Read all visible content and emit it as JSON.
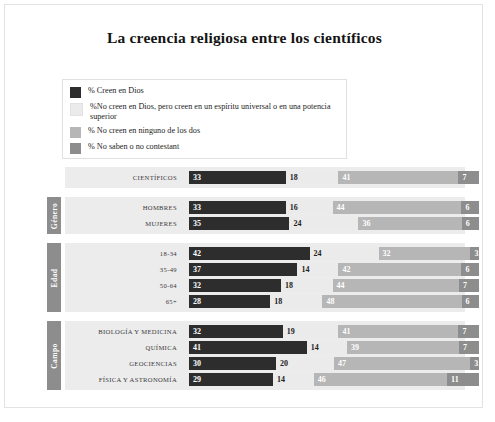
{
  "chart_data": {
    "type": "bar",
    "subtype": "stacked-horizontal-100",
    "title": "La creencia religiosa entre los científicos",
    "xlabel": "",
    "ylabel": "",
    "xlim": [
      0,
      100
    ],
    "grid": false,
    "legend_position": "top-left",
    "series": [
      {
        "name": "% Creen en Dios",
        "color": "#2d2d2d"
      },
      {
        "name": "%No creen en Dios, pero creen en un espíritu universal o en una potencia superior",
        "color": "#ebebeb"
      },
      {
        "name": "%  No creen en ninguno de los dos",
        "color": "#b6b6b6"
      },
      {
        "name": "% No saben o no contestant",
        "color": "#8d8d8d"
      }
    ],
    "groups": [
      {
        "name": "",
        "rows": [
          {
            "category": "Científicos",
            "values": [
              33,
              18,
              41,
              7
            ]
          }
        ]
      },
      {
        "name": "Género",
        "rows": [
          {
            "category": "Hombres",
            "values": [
              33,
              16,
              44,
              6
            ]
          },
          {
            "category": "Mujeres",
            "values": [
              35,
              24,
              36,
              6
            ]
          }
        ]
      },
      {
        "name": "Edad",
        "rows": [
          {
            "category": "18-34",
            "values": [
              42,
              24,
              32,
              3
            ]
          },
          {
            "category": "35-49",
            "values": [
              37,
              14,
              42,
              6
            ]
          },
          {
            "category": "50-64",
            "values": [
              32,
              18,
              44,
              7
            ]
          },
          {
            "category": "65+",
            "values": [
              28,
              18,
              48,
              6
            ]
          }
        ]
      },
      {
        "name": "Campo",
        "rows": [
          {
            "category": "Biología y medicina",
            "values": [
              32,
              19,
              41,
              7
            ]
          },
          {
            "category": "Química",
            "values": [
              41,
              14,
              39,
              7
            ]
          },
          {
            "category": "Geociencias",
            "values": [
              30,
              20,
              47,
              3
            ]
          },
          {
            "category": "Física y astronomía",
            "values": [
              29,
              14,
              46,
              11
            ]
          }
        ]
      }
    ]
  },
  "legend": {
    "items": [
      {
        "label": "% Creen en Dios",
        "color": "#2d2d2d"
      },
      {
        "label": "%No creen en Dios, pero creen en un espíritu universal o en una potencia superior",
        "color": "#ebebeb"
      },
      {
        "label": "%  No creen en ninguno de los dos",
        "color": "#b6b6b6"
      },
      {
        "label": "% No saben o no contestant",
        "color": "#8d8d8d"
      }
    ]
  },
  "colors": {
    "series_1": "#2d2d2d",
    "series_2": "#ebebeb",
    "series_3": "#b6b6b6",
    "series_4": "#8d8d8d",
    "group_band": "#ececec",
    "group_tab": "#8d8d8d",
    "card_background": "#ffffff"
  }
}
